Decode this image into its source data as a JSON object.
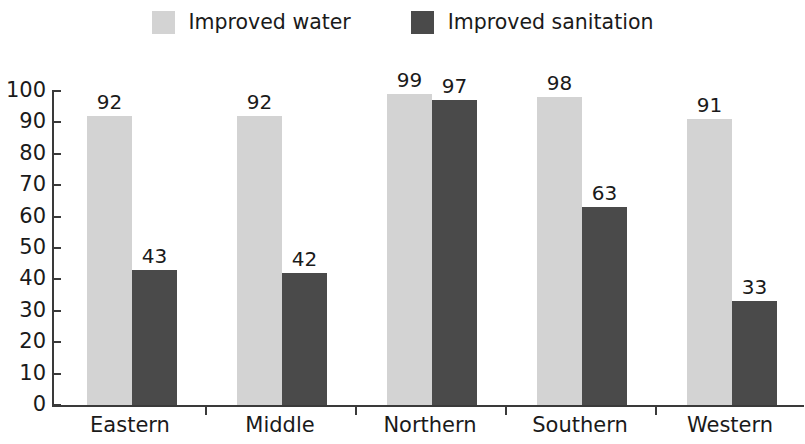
{
  "legend": {
    "entries": [
      {
        "label": "Improved water",
        "color": "#d3d3d3",
        "series_key": "improved_water"
      },
      {
        "label": "Improved sanitation",
        "color": "#4a4a4a",
        "series_key": "improved_sanitation"
      }
    ]
  },
  "chart_data": {
    "type": "bar",
    "title": "",
    "subtitle": "",
    "xlabel": "",
    "ylabel": "",
    "ylim": [
      0,
      100
    ],
    "ytick_step": 10,
    "yticks": [
      "100",
      "90",
      "80",
      "70",
      "60",
      "50",
      "40",
      "30",
      "20",
      "10",
      "0"
    ],
    "grid": false,
    "legend_position": "top-center",
    "categories": [
      "Eastern",
      "Middle",
      "Northern",
      "Southern",
      "Western"
    ],
    "series": [
      {
        "name": "Improved water",
        "color": "#d3d3d3",
        "values": [
          92,
          92,
          99,
          98,
          91
        ],
        "labels": [
          "92",
          "92",
          "99",
          "98",
          "91"
        ]
      },
      {
        "name": "Improved sanitation",
        "color": "#4a4a4a",
        "values": [
          43,
          42,
          97,
          63,
          33
        ],
        "labels": [
          "43",
          "42",
          "97",
          "63",
          "33"
        ]
      }
    ]
  },
  "geometry": {
    "baseline_y": 405,
    "top_y": 91,
    "axis_x": 52,
    "group_width": 150,
    "group_start_x": 87,
    "bar_width": 45,
    "tick_xs": [
      205,
      355,
      505,
      655
    ],
    "cat_centers": [
      130,
      280,
      430,
      580,
      730
    ]
  }
}
